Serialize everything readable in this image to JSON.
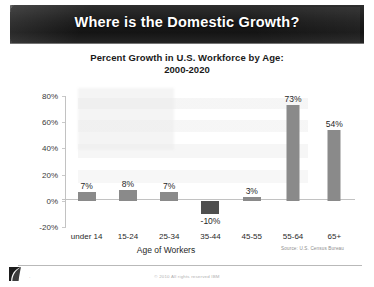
{
  "slide": {
    "banner_title": "Where is the Domestic Growth?",
    "logo_icon": "swoosh-logo-icon",
    "footer_mark": "·",
    "copyright": "© 2010 All rights reserved IBM"
  },
  "chart_data": {
    "type": "bar",
    "title": "Percent Growth in U.S. Workforce by Age:",
    "subtitle": "2000-2020",
    "xlabel": "Age of Workers",
    "ylabel": "",
    "categories": [
      "under 14",
      "15-24",
      "25-34",
      "35-44",
      "45-55",
      "55-64",
      "65+"
    ],
    "values": [
      7,
      8,
      7,
      -10,
      3,
      73,
      54
    ],
    "value_labels": [
      "7%",
      "8%",
      "7%",
      "-10%",
      "3%",
      "73%",
      "54%"
    ],
    "ylim": [
      -20,
      80
    ],
    "yticks": [
      80,
      60,
      40,
      20,
      0,
      -20
    ],
    "ytick_labels": [
      "80%",
      "60%",
      "40%",
      "20%",
      "0%",
      "-20%"
    ],
    "grid": false,
    "legend": "none",
    "bar_color": "#8a8a8a",
    "negative_bar_color": "#4f4f4f",
    "source": "Source: U.S. Census Bureau"
  }
}
